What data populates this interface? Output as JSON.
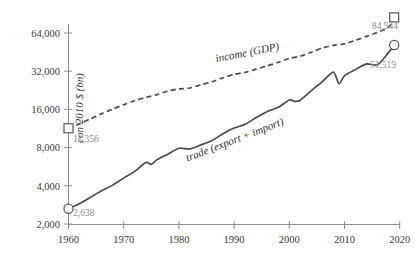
{
  "chart_data": {
    "type": "line",
    "title": "",
    "xlabel": "",
    "ylabel": "con 2010 $ (bn)",
    "yscale": "log2",
    "ylim": [
      2000,
      80000
    ],
    "xlim": [
      1960,
      2019
    ],
    "grid": false,
    "legend": "inline-annotations",
    "y_ticks": [
      {
        "value": 2000,
        "label": "2,000"
      },
      {
        "value": 4000,
        "label": "4,000"
      },
      {
        "value": 8000,
        "label": "8,000"
      },
      {
        "value": 16000,
        "label": "16,000"
      },
      {
        "value": 32000,
        "label": "32,000"
      },
      {
        "value": 64000,
        "label": "64,000"
      }
    ],
    "x_ticks": [
      {
        "value": 1960,
        "label": "1960"
      },
      {
        "value": 1970,
        "label": "1970"
      },
      {
        "value": 1980,
        "label": "1980"
      },
      {
        "value": 1990,
        "label": "1990"
      },
      {
        "value": 2000,
        "label": "2000"
      },
      {
        "value": 2010,
        "label": "2010"
      },
      {
        "value": 2020,
        "label": "2020"
      }
    ],
    "series": [
      {
        "name": "income (GDP)",
        "style": "dashed",
        "marker": "square",
        "annotation": "income (GDP)",
        "start_value_label": "11,356",
        "end_value_label": "84,944",
        "x": [
          1960,
          1962,
          1964,
          1966,
          1968,
          1970,
          1972,
          1974,
          1976,
          1978,
          1980,
          1982,
          1984,
          1986,
          1988,
          1990,
          1992,
          1994,
          1996,
          1998,
          2000,
          2002,
          2004,
          2006,
          2008,
          2010,
          2012,
          2014,
          2016,
          2018,
          2019
        ],
        "values": [
          11356,
          12300,
          13500,
          14800,
          16100,
          17400,
          18700,
          19900,
          20900,
          22300,
          23200,
          23600,
          25000,
          26400,
          28400,
          30200,
          31300,
          33200,
          35300,
          37600,
          40400,
          42000,
          45200,
          48800,
          51200,
          52500,
          56000,
          60200,
          64900,
          70800,
          84944
        ]
      },
      {
        "name": "trade (export + import)",
        "style": "solid",
        "marker": "circle",
        "annotation": "trade (export + import)",
        "start_value_label": "2,638",
        "end_value_label": "51,519",
        "x": [
          1960,
          1962,
          1964,
          1966,
          1968,
          1970,
          1972,
          1974,
          1975,
          1976,
          1978,
          1980,
          1982,
          1984,
          1986,
          1988,
          1990,
          1992,
          1994,
          1996,
          1998,
          2000,
          2001,
          2002,
          2004,
          2006,
          2008,
          2009,
          2010,
          2012,
          2014,
          2016,
          2018,
          2019
        ],
        "values": [
          2638,
          2900,
          3250,
          3650,
          4050,
          4600,
          5200,
          6100,
          5900,
          6400,
          7100,
          7900,
          7800,
          8400,
          9100,
          10300,
          11400,
          12200,
          13800,
          15400,
          16600,
          19000,
          18500,
          18900,
          22500,
          26500,
          31500,
          25500,
          29500,
          33000,
          36500,
          36000,
          45000,
          51519
        ]
      }
    ]
  }
}
